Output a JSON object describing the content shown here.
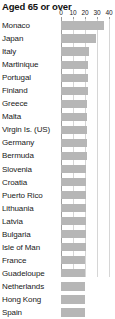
{
  "chart_data": {
    "type": "bar",
    "title": "Aged 65 or over",
    "xlabel": "",
    "ylabel": "",
    "orientation": "horizontal",
    "xlim": [
      0,
      40
    ],
    "grid": true,
    "legend": "none",
    "ticks": [
      0,
      10,
      20,
      30,
      40
    ],
    "tick_labels": [
      "0",
      "10",
      "20",
      "30",
      "40"
    ],
    "bar_color": "#b6b6b6",
    "gridline_color": "#d6d6d6",
    "categories": [
      "Monaco",
      "Japan",
      "Italy",
      "Martinique",
      "Portugal",
      "Finland",
      "Greece",
      "Malta",
      "Virgin Is. (US)",
      "Germany",
      "Bermuda",
      "Slovenia",
      "Croatia",
      "Puerto Rico",
      "Lithuania",
      "Latvia",
      "Bulgaria",
      "Isle of Man",
      "France",
      "Guadeloupe",
      "Netherlands",
      "Hong Kong",
      "Spain"
    ],
    "values": [
      36.0,
      29.0,
      23.3,
      22.4,
      22.1,
      22.1,
      22.0,
      21.8,
      21.5,
      21.5,
      21.3,
      21.0,
      21.0,
      20.8,
      20.6,
      20.6,
      20.6,
      20.5,
      20.4,
      20.3,
      20.1,
      20.0,
      20.0
    ]
  }
}
